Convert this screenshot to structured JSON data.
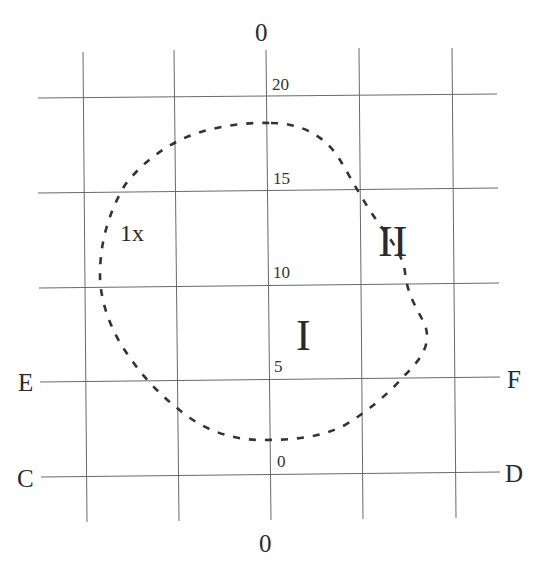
{
  "diagram": {
    "type": "grid contour map",
    "axis_labels": {
      "top": "0",
      "bottom": "0"
    },
    "edge_labels": {
      "left_upper": "E",
      "right_upper": "F",
      "left_lower": "C",
      "right_lower": "D"
    },
    "tick_labels": [
      "20",
      "15",
      "10",
      "5",
      "0"
    ],
    "region_labels": {
      "one_x": "1x",
      "region_one": "I",
      "region_two": "II"
    },
    "grid": {
      "vertical_lines": 5,
      "horizontal_lines": 5,
      "line_color": "#6a6a6a"
    },
    "contour": {
      "style": "dashed",
      "color": "#333333"
    }
  }
}
